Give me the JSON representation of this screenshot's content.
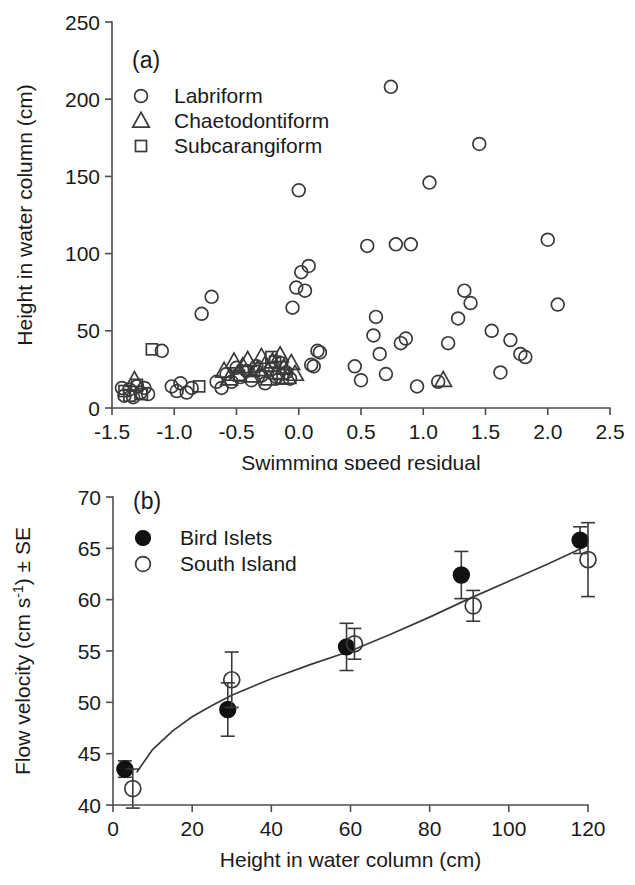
{
  "figure": {
    "background": "#ffffff",
    "ink": "#1a1a1a",
    "marker_stroke": "#3a3a3a",
    "filled_color": "#111111"
  },
  "chart_data": [
    {
      "id": "panel-a",
      "type": "scatter",
      "panel_label": "(a)",
      "title": "",
      "xlabel": "Swimming speed residual",
      "ylabel": "Height in water column (cm)",
      "xlim": [
        -1.5,
        2.5
      ],
      "ylim": [
        0,
        250
      ],
      "xticks": [
        -1.5,
        -1.0,
        -0.5,
        0.0,
        0.5,
        1.0,
        1.5,
        2.0,
        2.5
      ],
      "xticklabels": [
        "-1.5",
        "-1.0",
        "-0.5",
        "0.0",
        "0.5",
        "1.0",
        "1.5",
        "2.0",
        "2.5"
      ],
      "yticks": [
        0,
        50,
        100,
        150,
        200,
        250
      ],
      "yticklabels": [
        "0",
        "50",
        "100",
        "150",
        "200",
        "250"
      ],
      "grid": false,
      "legend_position": "top-left",
      "legend": [
        {
          "label": "Labriform",
          "marker": "circle-open"
        },
        {
          "label": "Chaetodontiform",
          "marker": "triangle-open"
        },
        {
          "label": "Subcarangiform",
          "marker": "square-open"
        }
      ],
      "series": [
        {
          "name": "Labriform",
          "marker": "circle-open",
          "points": [
            [
              -1.42,
              13
            ],
            [
              -1.4,
              8
            ],
            [
              -1.36,
              12
            ],
            [
              -1.33,
              7
            ],
            [
              -1.3,
              14
            ],
            [
              -1.27,
              10
            ],
            [
              -1.24,
              13
            ],
            [
              -1.21,
              9
            ],
            [
              -1.1,
              37
            ],
            [
              -1.02,
              14
            ],
            [
              -0.98,
              11
            ],
            [
              -0.95,
              16
            ],
            [
              -0.9,
              10
            ],
            [
              -0.86,
              13
            ],
            [
              -0.78,
              61
            ],
            [
              -0.7,
              72
            ],
            [
              -0.66,
              17
            ],
            [
              -0.62,
              13
            ],
            [
              -0.58,
              22
            ],
            [
              -0.54,
              17
            ],
            [
              -0.5,
              26
            ],
            [
              -0.47,
              20
            ],
            [
              -0.42,
              24
            ],
            [
              -0.38,
              18
            ],
            [
              -0.34,
              27
            ],
            [
              -0.3,
              21
            ],
            [
              -0.27,
              16
            ],
            [
              -0.22,
              25
            ],
            [
              -0.18,
              20
            ],
            [
              -0.14,
              29
            ],
            [
              -0.1,
              23
            ],
            [
              -0.07,
              19
            ],
            [
              -0.05,
              65
            ],
            [
              -0.02,
              78
            ],
            [
              0.0,
              141
            ],
            [
              0.02,
              88
            ],
            [
              0.05,
              76
            ],
            [
              0.08,
              92
            ],
            [
              0.1,
              28
            ],
            [
              0.12,
              27
            ],
            [
              0.15,
              37
            ],
            [
              0.17,
              36
            ],
            [
              0.45,
              27
            ],
            [
              0.5,
              18
            ],
            [
              0.55,
              105
            ],
            [
              0.6,
              47
            ],
            [
              0.62,
              59
            ],
            [
              0.65,
              35
            ],
            [
              0.7,
              22
            ],
            [
              0.74,
              208
            ],
            [
              0.78,
              106
            ],
            [
              0.82,
              42
            ],
            [
              0.86,
              45
            ],
            [
              0.9,
              106
            ],
            [
              0.95,
              14
            ],
            [
              1.05,
              146
            ],
            [
              1.12,
              17
            ],
            [
              1.2,
              42
            ],
            [
              1.28,
              58
            ],
            [
              1.33,
              76
            ],
            [
              1.38,
              68
            ],
            [
              1.45,
              171
            ],
            [
              1.55,
              50
            ],
            [
              1.62,
              23
            ],
            [
              1.7,
              44
            ],
            [
              1.78,
              35
            ],
            [
              1.82,
              33
            ],
            [
              2.0,
              109
            ],
            [
              2.08,
              67
            ]
          ]
        },
        {
          "name": "Chaetodontiform",
          "marker": "triangle-open",
          "points": [
            [
              -1.32,
              18
            ],
            [
              -0.6,
              24
            ],
            [
              -0.56,
              19
            ],
            [
              -0.52,
              30
            ],
            [
              -0.49,
              22
            ],
            [
              -0.45,
              27
            ],
            [
              -0.41,
              31
            ],
            [
              -0.37,
              21
            ],
            [
              -0.33,
              25
            ],
            [
              -0.3,
              33
            ],
            [
              -0.27,
              28
            ],
            [
              -0.24,
              19
            ],
            [
              -0.21,
              30
            ],
            [
              -0.18,
              23
            ],
            [
              -0.15,
              34
            ],
            [
              -0.12,
              26
            ],
            [
              -0.09,
              20
            ],
            [
              -0.06,
              29
            ],
            [
              -0.03,
              22
            ],
            [
              1.16,
              18
            ]
          ]
        },
        {
          "name": "Subcarangiform",
          "marker": "square-open",
          "points": [
            [
              -1.4,
              11
            ],
            [
              -1.36,
              8
            ],
            [
              -1.3,
              15
            ],
            [
              -1.26,
              9
            ],
            [
              -1.18,
              38
            ],
            [
              -0.8,
              14
            ],
            [
              -0.48,
              21
            ],
            [
              -0.36,
              24
            ],
            [
              -0.22,
              33
            ],
            [
              -0.19,
              30
            ],
            [
              -0.16,
              22
            ],
            [
              -0.13,
              19
            ]
          ]
        }
      ]
    },
    {
      "id": "panel-b",
      "type": "scatter",
      "panel_label": "(b)",
      "title": "",
      "xlabel": "Height in water column (cm)",
      "ylabel_parts": {
        "pre": "Flow velocity (cm s",
        "sup": "-1",
        "post": ") ± SE"
      },
      "ylabel": "Flow velocity (cm s-1) ± SE",
      "xlim": [
        0,
        120
      ],
      "ylim": [
        40,
        70
      ],
      "xticks": [
        0,
        20,
        40,
        60,
        80,
        100,
        120
      ],
      "xticklabels": [
        "0",
        "20",
        "40",
        "60",
        "80",
        "100",
        "120"
      ],
      "yticks": [
        40,
        45,
        50,
        55,
        60,
        65,
        70
      ],
      "yticklabels": [
        "40",
        "45",
        "50",
        "55",
        "60",
        "65",
        "70"
      ],
      "grid": false,
      "legend_position": "top-left",
      "legend": [
        {
          "label": "Bird Islets",
          "marker": "circle-filled"
        },
        {
          "label": "South Island",
          "marker": "circle-open"
        }
      ],
      "series": [
        {
          "name": "Bird Islets",
          "marker": "circle-filled",
          "points": [
            {
              "x": 3,
              "y": 43.5,
              "err": 0.8
            },
            {
              "x": 29,
              "y": 49.3,
              "err": 2.6
            },
            {
              "x": 59,
              "y": 55.4,
              "err": 2.3
            },
            {
              "x": 88,
              "y": 62.4,
              "err": 2.3
            },
            {
              "x": 118,
              "y": 65.8,
              "err": 1.3
            }
          ]
        },
        {
          "name": "South Island",
          "marker": "circle-open",
          "points": [
            {
              "x": 5,
              "y": 41.6,
              "err": 1.9
            },
            {
              "x": 30,
              "y": 52.2,
              "err": 2.7
            },
            {
              "x": 61,
              "y": 55.7,
              "err": 1.5
            },
            {
              "x": 91,
              "y": 59.4,
              "err": 1.5
            },
            {
              "x": 120,
              "y": 63.9,
              "err": 3.6
            }
          ]
        }
      ],
      "fit_curve": {
        "description": "logarithmic fit line",
        "points": [
          [
            6,
            43.2
          ],
          [
            10,
            45.4
          ],
          [
            15,
            47.2
          ],
          [
            20,
            48.6
          ],
          [
            25,
            49.7
          ],
          [
            30,
            50.7
          ],
          [
            40,
            52.3
          ],
          [
            50,
            53.7
          ],
          [
            60,
            55.0
          ],
          [
            70,
            56.6
          ],
          [
            80,
            58.3
          ],
          [
            90,
            60.1
          ],
          [
            100,
            61.8
          ],
          [
            110,
            63.5
          ],
          [
            120,
            65.3
          ]
        ]
      }
    }
  ]
}
